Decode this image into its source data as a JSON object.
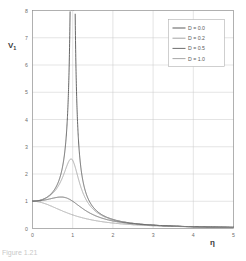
{
  "figure": {
    "caption": "Figure 1.21",
    "background": "#ffffff"
  },
  "chart_data": {
    "type": "line",
    "title": "",
    "subtitle": "",
    "xlabel": "η",
    "ylabel": "V₁",
    "xlim": [
      0,
      5
    ],
    "ylim": [
      0,
      8
    ],
    "xticks": [
      0,
      1,
      2,
      3,
      4,
      5
    ],
    "yticks": [
      0,
      1,
      2,
      3,
      4,
      5,
      6,
      7,
      8
    ],
    "xtick_labels": [
      "0",
      "1",
      "2",
      "3",
      "4",
      "5"
    ],
    "ytick_labels": [
      "0",
      "1",
      "2",
      "3",
      "4",
      "5",
      "6",
      "7",
      "8"
    ],
    "grid": true,
    "grid_color": "#c8c8c8",
    "frame_color": "#8f8f8f",
    "legend_position": "top-right",
    "formula": "V1 = 1 / sqrt((1 - eta^2)^2 + (2*D*eta)^2)",
    "series": [
      {
        "name": "D = 0.0",
        "damping": 0.0,
        "color": "#4a4a4a",
        "peak_eta": 1.0,
        "peak_value": 8.0,
        "note": "undamped resonance, asymptote at eta = 1"
      },
      {
        "name": "D = 0.2",
        "damping": 0.2,
        "color": "#9a9a9a",
        "peak_eta": 0.96,
        "peak_value": 2.55
      },
      {
        "name": "D = 0.5",
        "damping": 0.5,
        "color": "#5c5c5c",
        "peak_eta": 0.71,
        "peak_value": 1.155
      },
      {
        "name": "D = 1.0",
        "damping": 1.0,
        "color": "#9e9e9e",
        "peak_eta": 0.0,
        "peak_value": 1.0,
        "note": "monotonic, no peak"
      }
    ],
    "legend": {
      "entries": [
        "D = 0.0",
        "D = 0.2",
        "D = 0.5",
        "D = 1.0"
      ],
      "box_color": "#b0b0b0"
    }
  }
}
